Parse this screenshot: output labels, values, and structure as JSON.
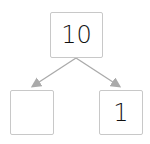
{
  "diagram": {
    "type": "number-bond",
    "whole": "10",
    "parts": [
      "",
      "1"
    ],
    "colors": {
      "border": "#c8c8c8",
      "arrow": "#aaaaaa",
      "text": "#111111"
    }
  }
}
